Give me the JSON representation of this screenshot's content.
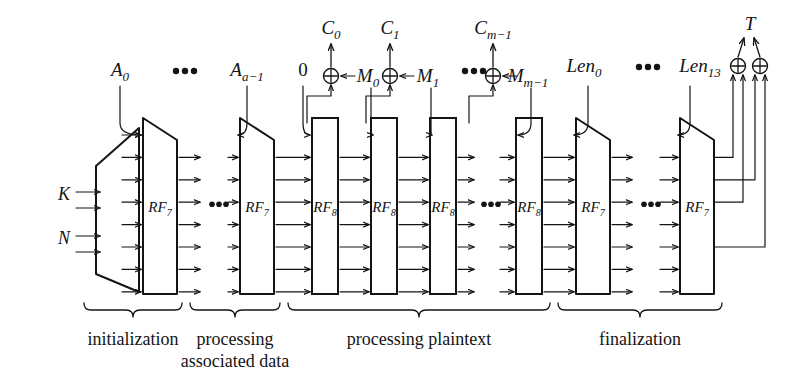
{
  "figure": {
    "background": "#ffffff",
    "ink": "#141414",
    "lanes": 8,
    "ellipsis_glyph": "•••"
  },
  "inputs": {
    "key_label": "K",
    "nonce_label": "N",
    "key_arrows": 2,
    "nonce_arrows": 2
  },
  "permutations": [
    {
      "id": "p0",
      "name": "RF",
      "sub": "7",
      "shape": "trapezoid",
      "stage": "initialization"
    },
    {
      "id": "p1",
      "name": "RF",
      "sub": "7",
      "shape": "trapezoid",
      "stage": "associated-data"
    },
    {
      "id": "p2",
      "name": "RF",
      "sub": "8",
      "shape": "rectangle",
      "stage": "plaintext"
    },
    {
      "id": "p3",
      "name": "RF",
      "sub": "8",
      "shape": "rectangle",
      "stage": "plaintext"
    },
    {
      "id": "p4",
      "name": "RF",
      "sub": "8",
      "shape": "rectangle",
      "stage": "plaintext"
    },
    {
      "id": "p5",
      "name": "RF",
      "sub": "8",
      "shape": "rectangle",
      "stage": "plaintext"
    },
    {
      "id": "p6",
      "name": "RF",
      "sub": "7",
      "shape": "trapezoid",
      "stage": "finalization"
    },
    {
      "id": "p7",
      "name": "RF",
      "sub": "7",
      "shape": "trapezoid",
      "stage": "finalization"
    }
  ],
  "top_inputs": [
    {
      "id": "a0",
      "text": "A",
      "sub": "0",
      "italic": true
    },
    {
      "id": "dots1",
      "text": "•••",
      "sub": "",
      "italic": false
    },
    {
      "id": "aa1",
      "text": "A",
      "sub": "a−1",
      "italic": true
    },
    {
      "id": "zero",
      "text": "0",
      "sub": "",
      "italic": false
    },
    {
      "id": "m0",
      "text": "M",
      "sub": "0",
      "italic": true
    },
    {
      "id": "m1",
      "text": "M",
      "sub": "1",
      "italic": true
    },
    {
      "id": "dots2",
      "text": "•••",
      "sub": "",
      "italic": false
    },
    {
      "id": "mm1",
      "text": "M",
      "sub": "m−1",
      "italic": true
    },
    {
      "id": "len0",
      "text": "Len",
      "sub": "0",
      "italic": true
    },
    {
      "id": "dots3",
      "text": "•••",
      "sub": "",
      "italic": false
    },
    {
      "id": "len13",
      "text": "Len",
      "sub": "13",
      "italic": true
    }
  ],
  "ciphertexts": [
    {
      "id": "c0",
      "text": "C",
      "sub": "0"
    },
    {
      "id": "c1",
      "text": "C",
      "sub": "1"
    },
    {
      "id": "cm1",
      "text": "C",
      "sub": "m−1"
    }
  ],
  "tag": {
    "text": "T",
    "sub": "",
    "xor_gates": 2
  },
  "xor_glyph": "⊕",
  "stage_labels": [
    {
      "id": "stage-init",
      "line1": "initialization",
      "line2": ""
    },
    {
      "id": "stage-ad",
      "line1": "processing",
      "line2": "associated data"
    },
    {
      "id": "stage-plaintext",
      "line1": "processing plaintext",
      "line2": ""
    },
    {
      "id": "stage-final",
      "line1": "finalization",
      "line2": ""
    }
  ]
}
